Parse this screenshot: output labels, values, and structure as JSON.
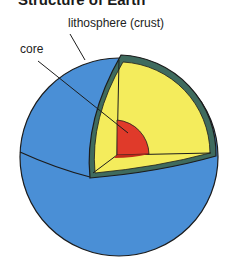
{
  "title": "Structure of Earth",
  "labels": {
    "lithosphere": "lithosphere (crust)",
    "core": "core"
  },
  "colors": {
    "surface": "#4a8fd6",
    "mantle": "#f4ec5c",
    "crust_band": "#3f6b5e",
    "core": "#e03a2a",
    "outline": "#1c1c1c"
  }
}
